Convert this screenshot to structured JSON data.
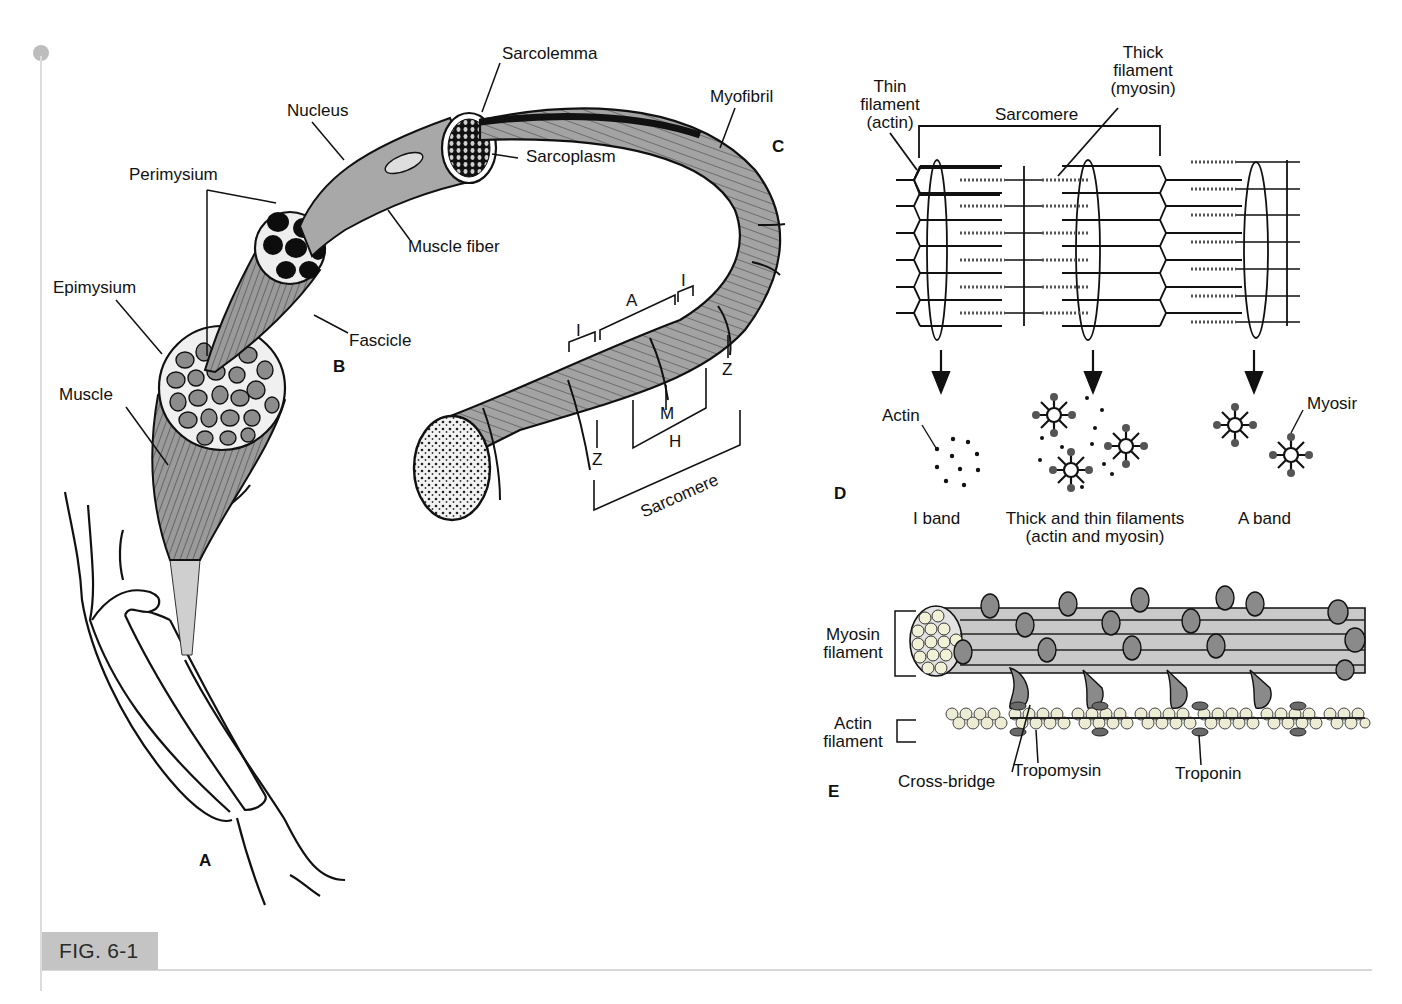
{
  "figure": {
    "label": "FIG. 6-1",
    "colors": {
      "ink": "#111111",
      "muscle_fill": "#8c8c8c",
      "light_fill": "#c8c8c8",
      "badge": "#c4c4c4",
      "rule": "#d8d8d8"
    }
  },
  "panels": {
    "A": {
      "letter": "A",
      "labels": {
        "muscle": "Muscle",
        "epimysium": "Epimysium"
      }
    },
    "B": {
      "letter": "B",
      "labels": {
        "perimysium": "Perimysium",
        "fascicle": "Fascicle",
        "nucleus": "Nucleus",
        "muscle_fiber": "Muscle fiber"
      }
    },
    "C": {
      "letter": "C",
      "labels": {
        "sarcolemma": "Sarcolemma",
        "sarcoplasm": "Sarcoplasm",
        "myofibril": "Myofibril",
        "band_i_left": "I",
        "band_a": "A",
        "band_i_right": "I",
        "z_left": "Z",
        "z_right": "Z",
        "m_line": "M",
        "h_zone": "H",
        "sarcomere": "Sarcomere"
      }
    },
    "D": {
      "letter": "D",
      "labels": {
        "thin_filament": [
          "Thin",
          "filament",
          "(actin)"
        ],
        "thick_filament": [
          "Thick",
          "filament",
          "(myosin)"
        ],
        "sarcomere": "Sarcomere",
        "actin": "Actin",
        "myosin": "Myosir",
        "i_band": "I band",
        "overlap_line1": "Thick and thin filaments",
        "overlap_line2": "(actin and myosin)",
        "a_band": "A band"
      }
    },
    "E": {
      "letter": "E",
      "labels": {
        "myosin_filament": [
          "Myosin",
          "filament"
        ],
        "actin_filament": [
          "Actin",
          "filament"
        ],
        "cross_bridge": "Cross-bridge",
        "tropomyosin": "Tropomysin",
        "troponin": "Troponin"
      }
    }
  }
}
